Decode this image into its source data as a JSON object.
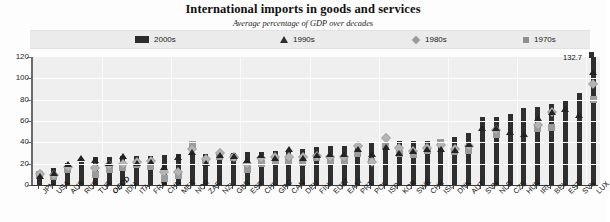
{
  "chart_data": {
    "type": "bar",
    "title": "International imports in goods and services",
    "subtitle": "Average percentage of GDP over decades",
    "xlabel": "",
    "ylabel": "",
    "ylim": [
      0,
      120
    ],
    "yticks": [
      0,
      20,
      40,
      60,
      80,
      100,
      120
    ],
    "grid": true,
    "legend_position": "top",
    "highlight_category": "OECD",
    "annotations": [
      {
        "category": "LUX",
        "series": "2000s",
        "text": "132.7",
        "note": "bar exceeds axis maximum"
      }
    ],
    "categories": [
      "JPN",
      "USA",
      "AUS",
      "RUS",
      "TUR",
      "OECD",
      "IDN",
      "ITA",
      "FRA",
      "CHN",
      "MEX",
      "NOR",
      "ZAF",
      "NZL",
      "GBR",
      "ESP",
      "CHL",
      "GRC",
      "CAN",
      "DEU",
      "FIN",
      "EU27",
      "EA17",
      "PRT",
      "POL",
      "ISR",
      "KOR",
      "SWE",
      "CHE",
      "ISL",
      "DNK",
      "AUT",
      "SVN",
      "NLD",
      "CZE",
      "HUN",
      "IRL",
      "BEL",
      "EST",
      "SVK",
      "LUX"
    ],
    "series": [
      {
        "name": "2000s",
        "marker": "bar",
        "color": "#2e2e2e",
        "values": [
          12.5,
          15.5,
          21.0,
          22.0,
          26.0,
          26.5,
          27.0,
          27.0,
          27.5,
          28.0,
          29.5,
          29.5,
          29.5,
          30.0,
          30.0,
          30.5,
          31.0,
          31.5,
          33.0,
          33.5,
          36.0,
          36.5,
          36.5,
          38.0,
          39.0,
          39.5,
          41.0,
          41.0,
          41.0,
          42.5,
          45.0,
          49.0,
          63.5,
          64.0,
          67.0,
          72.0,
          73.0,
          76.0,
          79.0,
          86.0,
          132.7
        ]
      },
      {
        "name": "1990s",
        "marker": "triangle",
        "color": "#232323",
        "values": [
          8.0,
          11.5,
          19.5,
          25.0,
          23.5,
          21.0,
          27.0,
          21.0,
          22.0,
          17.0,
          26.5,
          31.0,
          21.0,
          28.0,
          27.0,
          23.0,
          28.0,
          25.0,
          34.0,
          25.5,
          28.0,
          29.0,
          29.0,
          34.0,
          29.5,
          36.0,
          30.0,
          32.0,
          34.0,
          34.0,
          33.0,
          38.0,
          53.0,
          53.0,
          50.0,
          48.0,
          63.0,
          68.0,
          71.0,
          66.0,
          106.0
        ]
      },
      {
        "name": "1980s",
        "marker": "diamond",
        "color": "#b4b4b4",
        "values": [
          10.5,
          9.5,
          17.0,
          null,
          16.0,
          19.0,
          20.0,
          21.5,
          22.5,
          12.0,
          12.5,
          34.0,
          24.0,
          30.0,
          26.0,
          19.5,
          25.5,
          26.0,
          26.0,
          26.5,
          27.0,
          26.0,
          26.0,
          37.0,
          22.0,
          44.0,
          35.0,
          32.0,
          35.0,
          37.5,
          33.5,
          36.5,
          null,
          52.0,
          null,
          null,
          56.0,
          68.0,
          null,
          null,
          95.0
        ]
      },
      {
        "name": "1970s",
        "marker": "square",
        "color": "#9c9c9c",
        "values": [
          9.5,
          8.0,
          14.5,
          null,
          9.5,
          15.0,
          16.0,
          19.0,
          17.5,
          6.0,
          9.0,
          38.0,
          22.0,
          27.0,
          25.5,
          15.0,
          20.0,
          22.0,
          22.5,
          21.5,
          26.0,
          22.0,
          22.0,
          30.0,
          22.5,
          37.0,
          30.0,
          29.0,
          32.0,
          39.5,
          31.0,
          32.0,
          null,
          47.0,
          null,
          null,
          53.0,
          54.0,
          null,
          null,
          80.0
        ]
      }
    ]
  },
  "legend": {
    "items": [
      {
        "label": "2000s",
        "marker": "bar"
      },
      {
        "label": "1990s",
        "marker": "triangle"
      },
      {
        "label": "1980s",
        "marker": "diamond"
      },
      {
        "label": "1970s",
        "marker": "square"
      }
    ]
  }
}
